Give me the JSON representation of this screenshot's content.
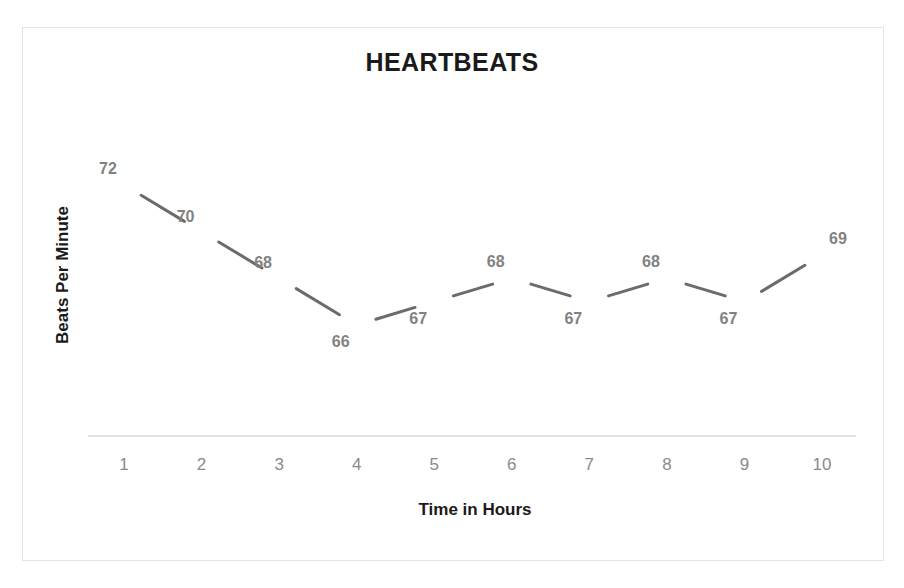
{
  "chart_data": {
    "type": "line",
    "title": "HEARTBEATS",
    "xlabel": "Time in Hours",
    "ylabel": "Beats Per Minute",
    "categories": [
      "1",
      "2",
      "3",
      "4",
      "5",
      "6",
      "7",
      "8",
      "9",
      "10"
    ],
    "values": [
      72,
      70,
      68,
      66,
      67,
      68,
      67,
      68,
      67,
      69
    ],
    "data_labels": [
      "72",
      "70",
      "68",
      "66",
      "67",
      "68",
      "67",
      "68",
      "67",
      "69"
    ],
    "ylim": [
      64.5,
      73.5
    ],
    "grid": false,
    "legend": "none",
    "series": [
      {
        "name": "Beats Per Minute",
        "values": [
          72,
          70,
          68,
          66,
          67,
          68,
          67,
          68,
          67,
          69
        ]
      }
    ],
    "colors": {
      "line": "#6b6b6b",
      "data_label": "#828282",
      "tick_label": "#8a8a8a",
      "axis_line": "#d9d9d9",
      "title": "#1a1a1a",
      "frame": "#e3e3e3",
      "background": "#ffffff"
    },
    "label_offsets": [
      {
        "dx": -16,
        "dy": -16
      },
      {
        "dx": -16,
        "dy": -15
      },
      {
        "dx": -16,
        "dy": -15
      },
      {
        "dx": -16,
        "dy": 17
      },
      {
        "dx": -16,
        "dy": 17
      },
      {
        "dx": -16,
        "dy": -16
      },
      {
        "dx": -16,
        "dy": 17
      },
      {
        "dx": -16,
        "dy": -16
      },
      {
        "dx": -16,
        "dy": 17
      },
      {
        "dx": 16,
        "dy": -16
      }
    ]
  }
}
